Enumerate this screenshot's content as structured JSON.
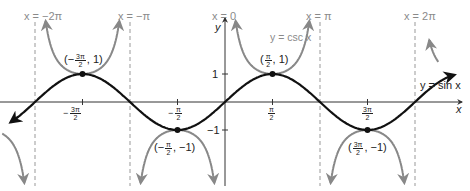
{
  "chart_data": {
    "type": "line",
    "title": "",
    "xlabel": "x",
    "ylabel": "y",
    "xlim": [
      -7.0,
      7.5
    ],
    "ylim": [
      -2.6,
      2.3
    ],
    "grid": false,
    "series": [
      {
        "name": "y = sin x",
        "function": "sin(x)",
        "color": "#111111",
        "style": "solid"
      },
      {
        "name": "y = csc x",
        "function": "1/sin(x)",
        "color": "#888888",
        "style": "solid"
      }
    ],
    "asymptotes": [
      "x = -2π",
      "x = -π",
      "x = 0",
      "x = π",
      "x = 2π"
    ],
    "x_ticks": [
      "-3π/2",
      "-π/2",
      "π/2",
      "3π/2"
    ],
    "y_ticks": [
      "1",
      "-1"
    ],
    "points": [
      {
        "label": "(-3π/2, 1)",
        "x": "-3π/2",
        "y": 1
      },
      {
        "label": "(π/2, 1)",
        "x": "π/2",
        "y": 1
      },
      {
        "label": "(-π/2, -1)",
        "x": "-π/2",
        "y": -1
      },
      {
        "label": "(3π/2, -1)",
        "x": "3π/2",
        "y": -1
      }
    ]
  },
  "labels": {
    "asym_m2pi": "x = −2π",
    "asym_mpi": "x = −π",
    "asym_0": "x = 0",
    "asym_pi": "x = π",
    "asym_2pi": "x = 2π",
    "csc_label": "y = csc x",
    "sin_label": "y = sin x",
    "x_axis": "x",
    "y_axis": "y",
    "y_tick_1": "1",
    "y_tick_m1": "−1",
    "pt_m3pi2": {
      "open": "(−",
      "num": "3π",
      "den": "2",
      "close": ", 1)"
    },
    "pt_pi2": {
      "open": "(",
      "num": "π",
      "den": "2",
      "close": ", 1)"
    },
    "pt_mpi2": {
      "open": "(−",
      "num": "π",
      "den": "2",
      "close": ", −1)"
    },
    "pt_3pi2": {
      "open": "(",
      "num": "3π",
      "den": "2",
      "close": ", −1)"
    },
    "tick_m3pi2": {
      "sign": "−",
      "num": "3π",
      "den": "2"
    },
    "tick_mpi2": {
      "sign": "−",
      "num": "π",
      "den": "2"
    },
    "tick_pi2": {
      "sign": "",
      "num": "π",
      "den": "2"
    },
    "tick_3pi2": {
      "sign": "",
      "num": "3π",
      "den": "2"
    }
  }
}
